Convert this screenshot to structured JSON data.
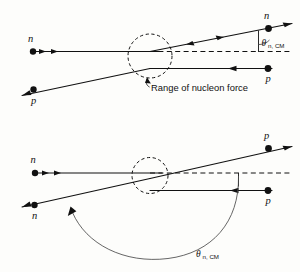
{
  "figure": {
    "background_color": "#fdfdfb",
    "stroke_color": "#111111",
    "arc_color": "#4a4a4a"
  },
  "diagrams": [
    {
      "id": "upper",
      "name": "direct-scattering-diagram",
      "caption": "Range of nucleon force",
      "angle_label": {
        "symbol": "θ",
        "subscript": "n, CM",
        "full": "θn, CM"
      },
      "particles": [
        {
          "id": "upper-in-n",
          "label": "n",
          "position": "left-upper",
          "role": "incoming"
        },
        {
          "id": "upper-in-p",
          "label": "p",
          "position": "left-lower",
          "role": "outgoing"
        },
        {
          "id": "upper-out-n",
          "label": "n",
          "position": "right-upper",
          "role": "outgoing"
        },
        {
          "id": "upper-out-p",
          "label": "p",
          "position": "right-lower",
          "role": "incoming"
        }
      ]
    },
    {
      "id": "lower",
      "name": "exchange-scattering-diagram",
      "caption": "",
      "angle_label": {
        "symbol": "θ",
        "subscript": "n, CM",
        "full": "θn, CM"
      },
      "particles": [
        {
          "id": "lower-in-n",
          "label": "n",
          "position": "left-upper",
          "role": "incoming"
        },
        {
          "id": "lower-out-n",
          "label": "n",
          "position": "left-lower",
          "role": "outgoing"
        },
        {
          "id": "lower-out-p",
          "label": "p",
          "position": "right-upper",
          "role": "outgoing"
        },
        {
          "id": "lower-in-p",
          "label": "p",
          "position": "right-lower",
          "role": "incoming"
        }
      ]
    }
  ],
  "elements": {
    "interaction_region_upper": "dashed-circle",
    "interaction_region_lower": "dashed-circle",
    "reference_axis_upper": "dashed-horizontal-line",
    "reference_axis_lower": "dashed-horizontal-line",
    "angle_arc_upper": "small-vertical-angle-marker",
    "angle_arc_lower": "large-sweeping-arc-with-arrowhead"
  }
}
